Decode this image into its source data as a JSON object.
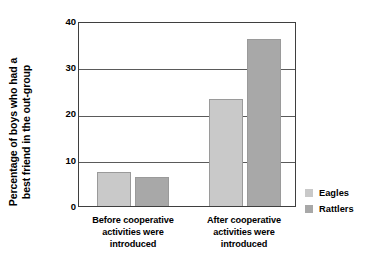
{
  "chart_data": {
    "type": "bar",
    "title": "",
    "xlabel": "",
    "ylabel_line1": "Percentage of boys who had a",
    "ylabel_line2": "best friend in the out-group",
    "ylim": [
      0,
      40
    ],
    "yticks": [
      "0",
      "10",
      "20",
      "30",
      "40"
    ],
    "grid": true,
    "legend_position": "right",
    "categories": [
      {
        "line1": "Before cooperative",
        "line2": "activities were",
        "line3": "introduced"
      },
      {
        "line1": "After cooperative",
        "line2": "activities were",
        "line3": "introduced"
      }
    ],
    "series": [
      {
        "name": "Eagles",
        "color": "#c9c9c9",
        "values": [
          7.5,
          23.3
        ]
      },
      {
        "name": "Rattlers",
        "color": "#a8a8a8",
        "values": [
          6.3,
          36.6
        ]
      }
    ]
  }
}
